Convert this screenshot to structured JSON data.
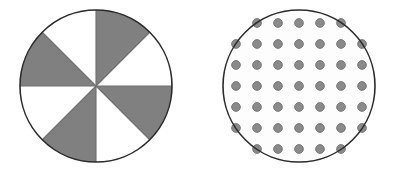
{
  "canvas": {
    "width": 399,
    "height": 172,
    "background_color": "#ffffff"
  },
  "figures": [
    {
      "id": "pinwheel-circle",
      "label": "Circle divided into eight alternating shaded and unshaded sectors",
      "shape": "circle",
      "center_x": 96,
      "center_y": 86,
      "radius": 76,
      "outline_color": "#2b2b2b",
      "outline_width": 1.6,
      "fill_color": "#ffffff",
      "sector_count": 8,
      "sector_angle_degrees": 45,
      "shaded_color": "#808080",
      "unshaded_color": "#ffffff",
      "shaded_fraction": "4/8",
      "start_angle_degrees": 270,
      "sectors": [
        {
          "index": 1,
          "start_deg": 270,
          "end_deg": 315,
          "state": "shaded"
        },
        {
          "index": 2,
          "start_deg": 315,
          "end_deg": 360,
          "state": "unshaded"
        },
        {
          "index": 3,
          "start_deg": 0,
          "end_deg": 45,
          "state": "shaded"
        },
        {
          "index": 4,
          "start_deg": 45,
          "end_deg": 90,
          "state": "unshaded"
        },
        {
          "index": 5,
          "start_deg": 90,
          "end_deg": 135,
          "state": "shaded"
        },
        {
          "index": 6,
          "start_deg": 135,
          "end_deg": 180,
          "state": "unshaded"
        },
        {
          "index": 7,
          "start_deg": 180,
          "end_deg": 225,
          "state": "shaded"
        },
        {
          "index": 8,
          "start_deg": 225,
          "end_deg": 270,
          "state": "unshaded"
        }
      ],
      "divider_color": "#6e6e6e",
      "divider_width": 1.1
    },
    {
      "id": "dotted-circle",
      "label": "Circle filled with a square grid of small gray dots",
      "shape": "circle",
      "center_x": 299,
      "center_y": 86,
      "radius": 76,
      "outline_color": "#2b2b2b",
      "outline_width": 1.6,
      "fill_color": "#fdfdfd",
      "dot_color": "#8a8a8a",
      "dot_edge_color": "#6b6b6b",
      "dot_radius": 4.4,
      "dot_spacing_x": 21,
      "dot_spacing_y": 21,
      "dot_rows": 7,
      "dot_total": 45,
      "dot_rows_detail": [
        {
          "row": 1,
          "y": 23,
          "count": 5,
          "xs": [
            257,
            278,
            299,
            320,
            341
          ]
        },
        {
          "row": 2,
          "y": 44,
          "count": 7,
          "xs": [
            236,
            257,
            278,
            299,
            320,
            341,
            362
          ]
        },
        {
          "row": 3,
          "y": 65,
          "count": 7,
          "xs": [
            236,
            257,
            278,
            299,
            320,
            341,
            362
          ]
        },
        {
          "row": 4,
          "y": 86,
          "count": 7,
          "xs": [
            236,
            257,
            278,
            299,
            320,
            341,
            362
          ]
        },
        {
          "row": 5,
          "y": 107,
          "count": 7,
          "xs": [
            236,
            257,
            278,
            299,
            320,
            341,
            362
          ]
        },
        {
          "row": 6,
          "y": 128,
          "count": 7,
          "xs": [
            236,
            257,
            278,
            299,
            320,
            341,
            362
          ]
        },
        {
          "row": 7,
          "y": 149,
          "count": 5,
          "xs": [
            257,
            278,
            299,
            320,
            341
          ]
        }
      ]
    }
  ]
}
